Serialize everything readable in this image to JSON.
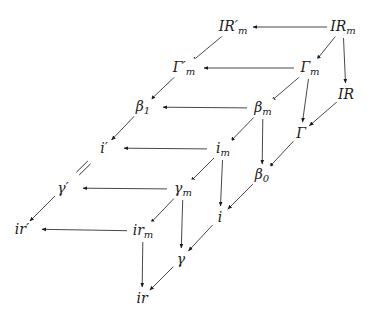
{
  "diagram": {
    "type": "commutative-cube-diagram",
    "nodes": [
      {
        "id": "IRpm",
        "label": "IR′",
        "sub": "m",
        "x": 233,
        "y": 27
      },
      {
        "id": "IRm",
        "label": "IR",
        "sub": "m",
        "x": 343,
        "y": 27
      },
      {
        "id": "Gpm",
        "label": "Γ′",
        "sub": "m",
        "x": 184,
        "y": 68
      },
      {
        "id": "Gm",
        "label": "Γ",
        "sub": "m",
        "x": 310,
        "y": 68
      },
      {
        "id": "IR",
        "label": "IR",
        "sub": "",
        "x": 346,
        "y": 94
      },
      {
        "id": "b1",
        "label": "β",
        "sub": "1",
        "x": 143,
        "y": 107
      },
      {
        "id": "bm",
        "label": "β",
        "sub": "m",
        "x": 263,
        "y": 108
      },
      {
        "id": "G",
        "label": "Γ",
        "sub": "",
        "x": 301,
        "y": 133
      },
      {
        "id": "ip",
        "label": "i′",
        "sub": "",
        "x": 104,
        "y": 148
      },
      {
        "id": "im",
        "label": "i",
        "sub": "m",
        "x": 223,
        "y": 149
      },
      {
        "id": "b0",
        "label": "β",
        "sub": "0",
        "x": 262,
        "y": 175
      },
      {
        "id": "gp",
        "label": "γ′",
        "sub": "",
        "x": 63,
        "y": 188
      },
      {
        "id": "gm",
        "label": "γ",
        "sub": "m",
        "x": 183,
        "y": 189
      },
      {
        "id": "i",
        "label": "i",
        "sub": "",
        "x": 220,
        "y": 217
      },
      {
        "id": "irp",
        "label": "ir′",
        "sub": "",
        "x": 22,
        "y": 229
      },
      {
        "id": "irm",
        "label": "ir",
        "sub": "m",
        "x": 143,
        "y": 231
      },
      {
        "id": "g",
        "label": "γ",
        "sub": "",
        "x": 181,
        "y": 259
      },
      {
        "id": "ir",
        "label": "ir",
        "sub": "",
        "x": 142,
        "y": 298
      }
    ],
    "arrows": [
      {
        "from": "IRm",
        "to": "IRpm"
      },
      {
        "from": "IRm",
        "to": "Gm"
      },
      {
        "from": "IRm",
        "to": "IR"
      },
      {
        "from": "IRpm",
        "to": "Gpm"
      },
      {
        "from": "Gm",
        "to": "Gpm"
      },
      {
        "from": "Gm",
        "to": "bm"
      },
      {
        "from": "Gm",
        "to": "G"
      },
      {
        "from": "IR",
        "to": "G"
      },
      {
        "from": "Gpm",
        "to": "b1"
      },
      {
        "from": "bm",
        "to": "b1"
      },
      {
        "from": "bm",
        "to": "im"
      },
      {
        "from": "bm",
        "to": "b0"
      },
      {
        "from": "G",
        "to": "b0"
      },
      {
        "from": "b1",
        "to": "ip"
      },
      {
        "from": "im",
        "to": "ip"
      },
      {
        "from": "im",
        "to": "gm"
      },
      {
        "from": "im",
        "to": "i"
      },
      {
        "from": "b0",
        "to": "i"
      },
      {
        "from": "gm",
        "to": "gp"
      },
      {
        "from": "gm",
        "to": "irm"
      },
      {
        "from": "gm",
        "to": "g"
      },
      {
        "from": "i",
        "to": "g"
      },
      {
        "from": "gp",
        "to": "irp"
      },
      {
        "from": "irm",
        "to": "irp"
      },
      {
        "from": "irm",
        "to": "ir"
      },
      {
        "from": "g",
        "to": "ir"
      }
    ],
    "equalities": [
      {
        "between": [
          "ip",
          "gp"
        ],
        "symbol": "="
      }
    ],
    "colors": {
      "stroke": "#1a1a1a",
      "background": "#ffffff"
    }
  }
}
